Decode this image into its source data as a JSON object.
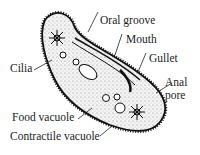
{
  "diagram": {
    "labels": {
      "oral_groove": "Oral groove",
      "mouth": "Mouth",
      "gullet": "Gullet",
      "anal_pore_line1": "Anal",
      "anal_pore_line2": "pore",
      "cilia": "Cilia",
      "food_vacuole": "Food vacuole",
      "contractile_vacuole": "Contractile vacuole"
    }
  }
}
